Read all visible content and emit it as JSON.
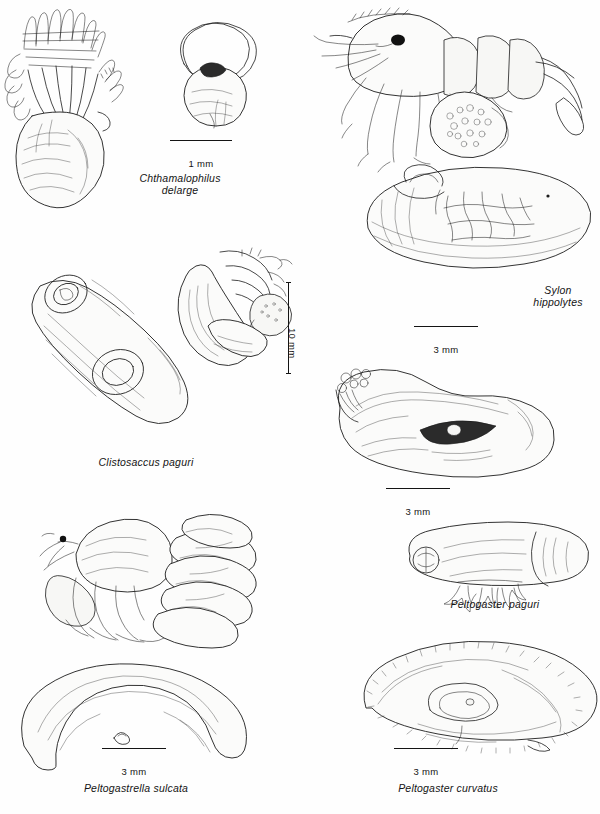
{
  "figure": {
    "kind": "scientific-illustration-plate",
    "background_color": "#fefefe",
    "ink_color": "#1c1c1c"
  },
  "panels": [
    {
      "id": "chthamalophilus",
      "caption": "Chthamalophilus\ndelarge",
      "caption_lines": [
        "Chthamalophilus",
        "delarge"
      ],
      "scale": {
        "label": "1 mm",
        "orientation": "horizontal"
      },
      "parts": [
        "dissected externa with cirri and mantle",
        "isolated externa in barnacle shell outline"
      ]
    },
    {
      "id": "sylon",
      "caption": "Sylon\nhippolytes",
      "caption_lines": [
        "Sylon",
        "hippolytes"
      ],
      "scale": {
        "label": "3 mm",
        "orientation": "horizontal"
      },
      "parts": [
        "shrimp host with externa beneath abdomen",
        "enlarged externa showing internal branching"
      ]
    },
    {
      "id": "clistosaccus",
      "caption": "Clistosaccus paguri",
      "caption_lines": [
        "Clistosaccus paguri"
      ],
      "scale": {
        "label": "10 mm",
        "orientation": "vertical"
      },
      "parts": [
        "large externa, ventral view",
        "externa attached to hermit crab abdomen"
      ]
    },
    {
      "id": "peltogaster-paguri",
      "caption": "Peltogaster paguri",
      "caption_lines": [
        "Peltogaster paguri"
      ],
      "scale": {
        "label": "3 mm",
        "orientation": "horizontal"
      },
      "parts": [
        "large kidney-shaped externa with mantle aperture",
        "smaller externa with host abdominal appendages"
      ]
    },
    {
      "id": "peltogastrella-sulcata",
      "caption": "Peltogastrella sulcata",
      "caption_lines": [
        "Peltogastrella sulcata"
      ],
      "scale": {
        "label": "3 mm",
        "orientation": "horizontal"
      },
      "parts": [
        "hermit crab bearing multiple externae",
        "single curved sausage-shaped externa"
      ]
    },
    {
      "id": "peltogaster-curvatus",
      "caption": "Peltogaster curvatus",
      "caption_lines": [
        "Peltogaster curvatus"
      ],
      "scale": {
        "label": "3 mm",
        "orientation": "horizontal"
      },
      "parts": [
        "broad spiny externa, lateral view"
      ]
    }
  ],
  "scale_bars": [
    {
      "id": "scale-1mm",
      "label": "1 mm"
    },
    {
      "id": "scale-3mm-sylon",
      "label": "3 mm"
    },
    {
      "id": "scale-10mm",
      "label": "10 mm"
    },
    {
      "id": "scale-3mm-peltogaster-paguri",
      "label": "3 mm"
    },
    {
      "id": "scale-3mm-peltogastrella",
      "label": "3 mm"
    },
    {
      "id": "scale-3mm-curvatus",
      "label": "3 mm"
    }
  ]
}
